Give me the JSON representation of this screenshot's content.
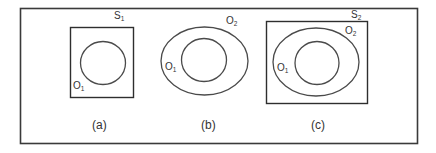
{
  "diagram": {
    "colors": {
      "stroke": "#3a3a3a",
      "text": "#333333",
      "background": "#ffffff"
    },
    "panels": [
      {
        "caption": "(a)",
        "box_label": {
          "base": "S",
          "sub": "1"
        },
        "outer_label": null,
        "inner_label": {
          "base": "O",
          "sub": "1"
        }
      },
      {
        "caption": "(b)",
        "box_label": null,
        "outer_label": {
          "base": "O",
          "sub": "2"
        },
        "inner_label": {
          "base": "O",
          "sub": "1"
        }
      },
      {
        "caption": "(c)",
        "box_label": {
          "base": "S",
          "sub": "2"
        },
        "outer_label": {
          "base": "O",
          "sub": "2"
        },
        "inner_label": {
          "base": "O",
          "sub": "1"
        }
      }
    ]
  }
}
